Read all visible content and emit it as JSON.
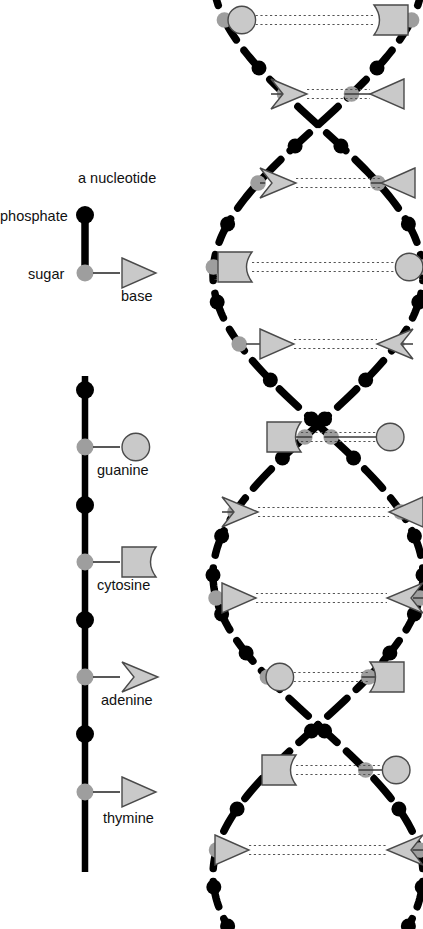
{
  "figure": {
    "background": "#ffffff"
  },
  "colors": {
    "phosphate": "#000000",
    "sugar": "#9e9e9e",
    "base_fill": "#c9c9c9",
    "base_stroke": "#4a4a4a",
    "backbone": "#000000",
    "bond_line": "#3a3a3a",
    "hbond": "#555555",
    "text": "#111111"
  },
  "legend": {
    "nucleotide_title": "a nucleotide",
    "phosphate_label": "phosphate",
    "sugar_label": "sugar",
    "base_label": "base",
    "phosphate_icon": "black-filled-circle",
    "sugar_icon": "gray-filled-circle",
    "base_icon": "triangle-right-outline"
  },
  "bases": {
    "guanine": {
      "name": "guanine",
      "shape": "circle",
      "pairs_with": "cytosine"
    },
    "cytosine": {
      "name": "cytosine",
      "shape": "notched-rectangle",
      "pairs_with": "guanine"
    },
    "adenine": {
      "name": "adenine",
      "shape": "notched-arrow",
      "pairs_with": "thymine"
    },
    "thymine": {
      "name": "thymine",
      "shape": "triangle",
      "pairs_with": "adenine"
    }
  },
  "strand_chain": {
    "caption": "single strand showing four bases",
    "x": 85,
    "units": [
      {
        "kind": "phosphate",
        "y": 390
      },
      {
        "kind": "sugar",
        "y": 447,
        "base": "guanine",
        "label": "guanine",
        "label_y": 470
      },
      {
        "kind": "phosphate",
        "y": 505
      },
      {
        "kind": "sugar",
        "y": 562,
        "base": "cytosine",
        "label": "cytosine",
        "label_y": 585
      },
      {
        "kind": "phosphate",
        "y": 620
      },
      {
        "kind": "sugar",
        "y": 677,
        "base": "adenine",
        "label": "adenine",
        "label_y": 700
      },
      {
        "kind": "phosphate",
        "y": 734
      },
      {
        "kind": "sugar",
        "y": 792,
        "base": "thymine",
        "label": "thymine",
        "label_y": 818
      }
    ]
  },
  "helix": {
    "caption": "DNA double helix",
    "left_strand_center": 213,
    "right_strand_center": 415,
    "crossovers_y": [
      125,
      400,
      725
    ],
    "rungs": [
      {
        "y": 20,
        "left_base": "guanine",
        "right_base": "cytosine",
        "left_x": 228,
        "right_x": 408
      },
      {
        "y": 94,
        "left_base": "adenine",
        "right_base": "thymine",
        "left_x": 271,
        "right_x": 404
      },
      {
        "y": 183,
        "left_base": "adenine",
        "right_base": "thymine",
        "left_x": 260,
        "right_x": 415
      },
      {
        "y": 267,
        "left_base": "cytosine",
        "right_base": "guanine",
        "left_x": 218,
        "right_x": 423
      },
      {
        "y": 344,
        "left_base": "thymine",
        "right_base": "adenine",
        "left_x": 260,
        "right_x": 413
      },
      {
        "y": 437,
        "left_base": "cytosine",
        "right_base": "guanine",
        "left_x": 267,
        "right_x": 404
      },
      {
        "y": 512,
        "left_base": "adenine",
        "right_base": "thymine",
        "left_x": 222,
        "right_x": 423
      },
      {
        "y": 598,
        "left_base": "thymine",
        "right_base": "adenine",
        "left_x": 222,
        "right_x": 423
      },
      {
        "y": 677,
        "left_base": "guanine",
        "right_base": "cytosine",
        "left_x": 266,
        "right_x": 404
      },
      {
        "y": 770,
        "left_base": "cytosine",
        "right_base": "guanine",
        "left_x": 262,
        "right_x": 410
      },
      {
        "y": 850,
        "left_base": "thymine",
        "right_base": "adenine",
        "left_x": 215,
        "right_x": 423
      }
    ]
  }
}
